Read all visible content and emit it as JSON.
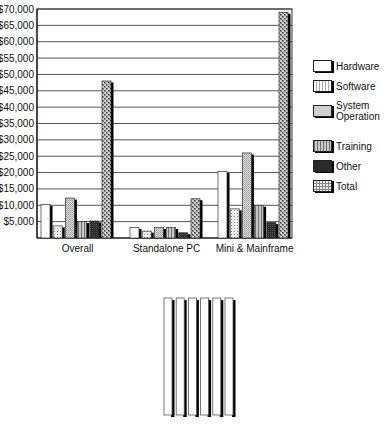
{
  "chart_data": {
    "type": "bar",
    "title": "",
    "xlabel": "",
    "ylabel": "",
    "ylim": [
      0,
      70000
    ],
    "grid": true,
    "legend_position": "right",
    "y_tick_labels": [
      "$5,000",
      "$10,000",
      "$15,000",
      "$20,000",
      "$25,000",
      "$30,000",
      "$35,000",
      "$40,000",
      "$45,000",
      "$50,000",
      "$55,000",
      "$60,000",
      "$65,000",
      "$70,000"
    ],
    "categories": [
      "Overall",
      "Standalone PC",
      "Mini & Mainframe"
    ],
    "series": [
      {
        "name": "Hardware",
        "pattern": "white",
        "values": [
          10300,
          3200,
          20300
        ]
      },
      {
        "name": "Software",
        "pattern": "dotted-light",
        "values": [
          3700,
          2100,
          8900
        ]
      },
      {
        "name": "System Operation",
        "pattern": "fine-gray",
        "values": [
          12200,
          3200,
          26000
        ]
      },
      {
        "name": "Training",
        "pattern": "vertical-stripes",
        "values": [
          5000,
          3200,
          10000
        ]
      },
      {
        "name": "Other",
        "pattern": "dark",
        "values": [
          5200,
          1600,
          4700
        ]
      },
      {
        "name": "Total",
        "pattern": "coarse-dotted",
        "values": [
          48000,
          12000,
          69000
        ]
      }
    ]
  },
  "legend": {
    "items": [
      {
        "label": "Hardware"
      },
      {
        "label": "Software"
      },
      {
        "label": "System Operation",
        "line1": "System",
        "line2": "Operation"
      },
      {
        "label": "Training"
      },
      {
        "label": "Other"
      },
      {
        "label": "Total"
      }
    ]
  },
  "bottom_figure": {
    "description": "six empty vertical bars with dark shadows",
    "bar_count": 6
  }
}
